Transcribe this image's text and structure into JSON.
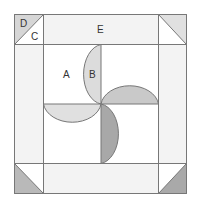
{
  "diagram": {
    "title": "",
    "labels": {
      "D": "D",
      "C": "C",
      "E": "E",
      "A": "A",
      "B": "B"
    },
    "colors": {
      "stroke": "#777777",
      "border_strip": "#f3f3f3",
      "center": "#ffffff",
      "corner_top_left_shaded": "#d6d6d6",
      "corner_top_right_shaded": "#e0e0e0",
      "corner_bottom_left_shaded": "#b9b9b9",
      "corner_bottom_right_shaded": "#a9a9a9",
      "blade_top": "#dcdcdc",
      "blade_right": "#c9c9c9",
      "blade_left": "#e0e0e0",
      "blade_bottom": "#a8a8a8"
    }
  }
}
